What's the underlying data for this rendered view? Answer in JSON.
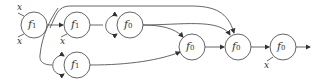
{
  "diagram": {
    "nodes": [
      {
        "id": "n1",
        "label": "f",
        "sub": "1"
      },
      {
        "id": "n2",
        "label": "f",
        "sub": "1"
      },
      {
        "id": "n3",
        "label": "f",
        "sub": "0"
      },
      {
        "id": "n4",
        "label": "f",
        "sub": "1"
      },
      {
        "id": "n5",
        "label": "f",
        "sub": "0"
      },
      {
        "id": "n6",
        "label": "f",
        "sub": "0"
      },
      {
        "id": "n7",
        "label": "f",
        "sub": "0"
      }
    ],
    "input_labels": [
      "x",
      "x",
      "x",
      "x"
    ],
    "colors": {
      "stroke": "#555555",
      "text": "#333333"
    }
  }
}
